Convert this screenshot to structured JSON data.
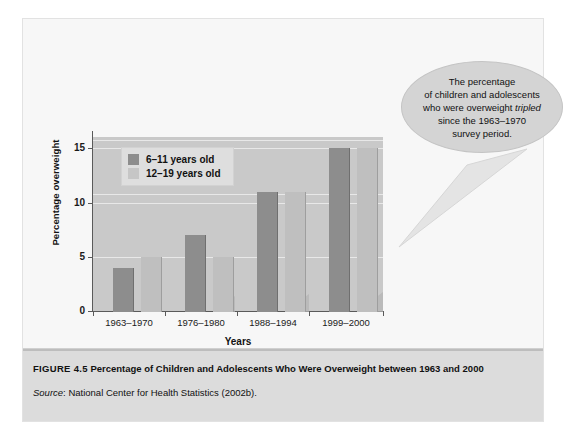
{
  "chart_data": {
    "type": "bar",
    "title": "",
    "xlabel": "Years",
    "ylabel": "Percentage overweight",
    "categories": [
      "1963–1970",
      "1976–1980",
      "1988–1994",
      "1999–2000"
    ],
    "series": [
      {
        "name": "6–11 years old",
        "values": [
          4,
          7,
          11,
          15
        ],
        "color": "#8d8d8d"
      },
      {
        "name": "12–19 years old",
        "values": [
          5,
          5,
          11,
          15
        ],
        "color": "#bfbfbf"
      }
    ],
    "ylim": [
      0,
      16
    ],
    "yticks": [
      0,
      5,
      10,
      15
    ],
    "ytick_labels": [
      "0",
      "5",
      "10",
      "15"
    ],
    "grid": true,
    "legend_position": "upper-left-inside",
    "annotations": [
      "The percentage of children and adolescents who were overweight tripled since the 1963–1970 survey period."
    ]
  },
  "legend": {
    "items": [
      {
        "label": "6–11 years old"
      },
      {
        "label": "12–19 years old"
      }
    ]
  },
  "axes": {
    "y_title": "Percentage overweight",
    "x_title": "Years"
  },
  "callout": {
    "line1": "The percentage",
    "line2": "of children and adolescents",
    "line3_a": "who were overweight ",
    "line3_em": "tripled",
    "line4": "since the 1963–1970",
    "line5": "survey period."
  },
  "caption": {
    "figure_number": "FIGURE 4.5",
    "figure_title": "Percentage of Children and Adolescents Who Were Overweight between 1963 and 2000",
    "source_word": "Source",
    "source_text": ": National Center for Health Statistics (2002b)."
  },
  "colors": {
    "series_a": "#8d8d8d",
    "series_b": "#bfbfbf",
    "plot_background": "#c9c9c9",
    "figure_background": "#f7f7f7",
    "caption_background": "#dcdcdc"
  }
}
